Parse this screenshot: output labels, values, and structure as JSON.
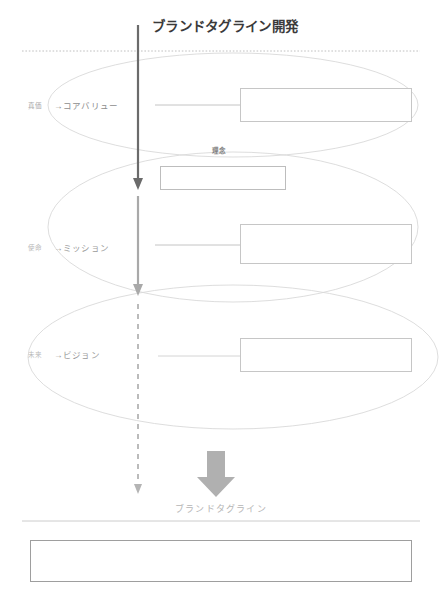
{
  "page": {
    "title": "ブランドタグライン開発",
    "background_color": "#ffffff",
    "width": 446,
    "height": 607
  },
  "colors": {
    "title_text": "#3a3a3a",
    "ellipse_stroke": "#d6d6d6",
    "box_border": "#c6c6c6",
    "answer_box_border": "#9e9e9e",
    "arrow_dark": "#6b6b6b",
    "arrow_mid": "#a9a9a9",
    "arrow_dashed": "#b4b4b4",
    "block_arrow": "#b0b0b0",
    "divider": "#cccccc",
    "label_text": "#9a9a9a",
    "prefix_text": "#b9b9b9"
  },
  "divider_top": {
    "style": "dotted",
    "color": "#c0c0c0"
  },
  "divider_bottom": {
    "style": "solid",
    "color": "#cccccc"
  },
  "rows": [
    {
      "id": "core-value",
      "prefix": "真価",
      "label": "→コアバリュー",
      "input_value": "",
      "input_placeholder": ""
    },
    {
      "id": "mission",
      "prefix": "使命",
      "label": "→ミッション",
      "input_value": "",
      "input_placeholder": ""
    },
    {
      "id": "vision",
      "prefix": "未来",
      "label": "→ビジョン",
      "input_value": "",
      "input_placeholder": ""
    }
  ],
  "rinen": {
    "label": "理念",
    "input_value": "",
    "input_placeholder": ""
  },
  "tagline": {
    "label": "ブランドタグライン",
    "input_value": "",
    "input_placeholder": ""
  },
  "flow": {
    "arrow_top_name": "downward-arrow-solid-dark",
    "arrow_mid_name": "downward-arrow-solid-gray",
    "arrow_bottom_name": "downward-arrow-dashed",
    "block_arrow_name": "block-down-arrow"
  }
}
